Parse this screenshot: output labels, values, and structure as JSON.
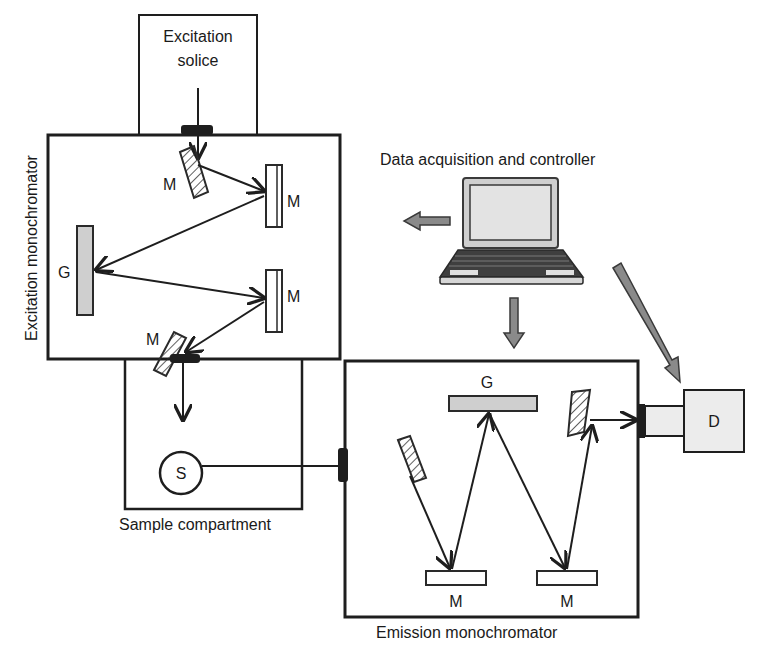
{
  "diagram": {
    "labels": {
      "excitation_source_line1": "Excitation",
      "excitation_source_line2": "solice",
      "excitation_monochromator": "Excitation monochromator",
      "data_acquisition": "Data acquisition and controller",
      "sample_compartment": "Sample compartment",
      "emission_monochromator": "Emission monochromator",
      "sample": "S",
      "detector": "D",
      "ex_mirror_1": "M",
      "ex_mirror_2": "M",
      "ex_grating": "G",
      "ex_mirror_3": "M",
      "ex_mirror_4": "M",
      "em_grating": "G",
      "em_mirror_1": "M",
      "em_mirror_2": "M"
    },
    "components": [
      {
        "id": "excitation-source",
        "label": "Excitation solice"
      },
      {
        "id": "excitation-monochromator",
        "label": "Excitation monochromator",
        "elements": [
          "M",
          "M",
          "G",
          "M",
          "M"
        ]
      },
      {
        "id": "sample-compartment",
        "label": "Sample compartment",
        "elements": [
          "S"
        ]
      },
      {
        "id": "emission-monochromator",
        "label": "Emission monochromator",
        "elements": [
          "G",
          "M",
          "M"
        ]
      },
      {
        "id": "detector",
        "label": "D"
      },
      {
        "id": "computer",
        "label": "Data acquisition and controller"
      }
    ],
    "colors": {
      "line": "#1e1e1e",
      "grating_fill": "#cfcfcf",
      "control_arrow": "#8a8a8a",
      "detector_fill": "#ececec",
      "screen_fill": "#d9d9d9"
    }
  }
}
